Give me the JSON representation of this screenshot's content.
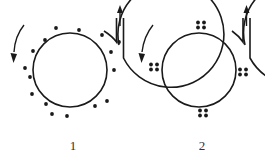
{
  "diagrams": [
    {
      "label": "1",
      "description": "particles uniformly distributed in annular channel",
      "particle_distribution": "uniform",
      "particle_count": 16,
      "flow_direction": "counter-clockwise",
      "outlet": "top-right, upward"
    },
    {
      "label": "2",
      "description": "particles grouped into clusters of four at four positions",
      "particle_distribution": "clustered",
      "cluster_count": 4,
      "particles_per_cluster": 4,
      "flow_direction": "counter-clockwise",
      "outlet": "top-right, upward"
    }
  ],
  "colors": {
    "stroke": "#1a1a1a",
    "particle": "#1a1a1a",
    "background": "#ffffff"
  }
}
